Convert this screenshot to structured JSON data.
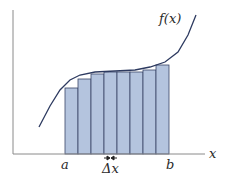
{
  "diagram": {
    "labels": {
      "function": "f(x)",
      "x_axis": "x",
      "a": "a",
      "b": "b",
      "delta_x": "Δx"
    },
    "colors": {
      "bar_fill": "#b4c4de",
      "bar_edge": "#3a4668",
      "curve": "#2d3a60",
      "axis": "#8a8a8a",
      "arrows": "#222222"
    },
    "rectangles": {
      "count": 8,
      "x_start": 65,
      "width": 13,
      "baseline_y": 154,
      "tops_y": [
        88,
        79,
        74,
        72,
        72,
        72,
        70,
        65
      ]
    },
    "curve_points": [
      [
        39,
        127
      ],
      [
        50,
        106
      ],
      [
        60,
        90
      ],
      [
        70,
        80
      ],
      [
        80,
        75
      ],
      [
        95,
        72
      ],
      [
        115,
        71
      ],
      [
        135,
        70
      ],
      [
        150,
        67
      ],
      [
        165,
        62
      ],
      [
        178,
        52
      ],
      [
        188,
        35
      ],
      [
        196,
        15
      ]
    ]
  }
}
